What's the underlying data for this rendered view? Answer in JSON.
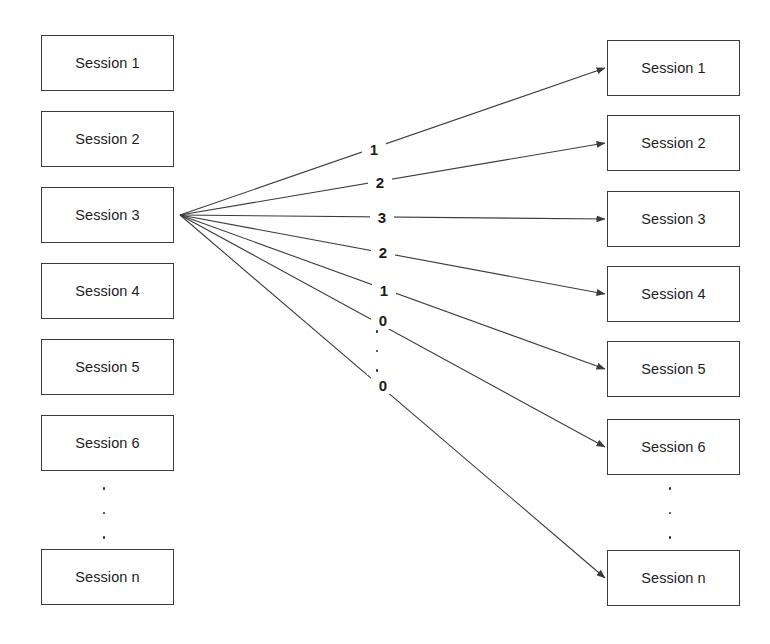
{
  "diagram": {
    "type": "fan-out-similarity-diagram",
    "canvas": {
      "width": 770,
      "height": 644,
      "background": "#ffffff"
    },
    "stroke_color": "#3b3b3b",
    "text_color": "#1d1d1d",
    "source_column": {
      "name": "left-session-column",
      "box_width": 133,
      "box_height": 56,
      "x": 41,
      "items": [
        {
          "label": "Session 1",
          "y": 35
        },
        {
          "label": "Session 2",
          "y": 111
        },
        {
          "label": "Session 3",
          "y": 187
        },
        {
          "label": "Session 4",
          "y": 263
        },
        {
          "label": "Session 5",
          "y": 339
        },
        {
          "label": "Session 6",
          "y": 415
        },
        {
          "label": "Session n",
          "y": 549
        }
      ],
      "ellipsis": {
        "x": 104,
        "y": 487,
        "height": 52
      },
      "highlighted_item_index": 2
    },
    "target_column": {
      "name": "right-session-column",
      "box_width": 133,
      "box_height": 56,
      "x": 607,
      "items": [
        {
          "label": "Session 1",
          "y": 40
        },
        {
          "label": "Session 2",
          "y": 115
        },
        {
          "label": "Session 3",
          "y": 191
        },
        {
          "label": "Session 4",
          "y": 266
        },
        {
          "label": "Session 5",
          "y": 341
        },
        {
          "label": "Session 6",
          "y": 419
        },
        {
          "label": "Session n",
          "y": 550
        }
      ],
      "ellipsis": {
        "x": 670,
        "y": 487,
        "height": 52
      }
    },
    "fan_origin": {
      "x": 180,
      "y": 215
    },
    "edges": [
      {
        "label": "1",
        "label_x": 365,
        "label_y": 140,
        "to_x": 605,
        "to_y": 68
      },
      {
        "label": "2",
        "label_x": 371,
        "label_y": 173,
        "to_x": 605,
        "to_y": 143
      },
      {
        "label": "3",
        "label_x": 373,
        "label_y": 208,
        "to_x": 605,
        "to_y": 219
      },
      {
        "label": "2",
        "label_x": 374,
        "label_y": 243,
        "to_x": 605,
        "to_y": 294
      },
      {
        "label": "1",
        "label_x": 375,
        "label_y": 281,
        "to_x": 605,
        "to_y": 369
      },
      {
        "label": "0",
        "label_x": 374,
        "label_y": 311,
        "to_x": 605,
        "to_y": 447
      },
      {
        "label": "0",
        "label_x": 374,
        "label_y": 376,
        "to_x": 605,
        "to_y": 578
      }
    ],
    "edge_label_ellipsis": {
      "x": 375,
      "y": 330,
      "height": 42
    }
  }
}
